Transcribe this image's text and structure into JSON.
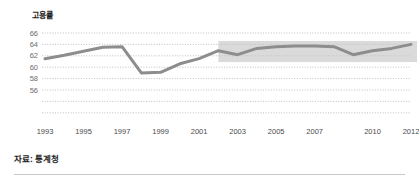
{
  "chart_data": {
    "type": "line",
    "title": "고용률",
    "xlabel": "",
    "ylabel": "",
    "ylim": [
      54,
      67
    ],
    "xlim": [
      1993,
      2012
    ],
    "grid": true,
    "legend": null,
    "yticks": [
      66,
      64,
      62,
      60,
      58,
      56
    ],
    "xticks": [
      1993,
      1995,
      1997,
      1999,
      2001,
      2003,
      2005,
      2007,
      2010,
      2012
    ],
    "x": [
      1993,
      1994,
      1995,
      1996,
      1997,
      1998,
      1999,
      2000,
      2001,
      2002,
      2003,
      2004,
      2005,
      2006,
      2007,
      2008,
      2009,
      2010,
      2011,
      2012
    ],
    "values": [
      61.5,
      62.1,
      62.8,
      63.5,
      63.6,
      59.0,
      59.1,
      60.6,
      61.5,
      62.9,
      62.2,
      63.3,
      63.6,
      63.7,
      63.7,
      63.6,
      62.2,
      62.9,
      63.3,
      64.0
    ],
    "series": [
      {
        "name": "고용률",
        "color": "#8d8d8d",
        "values": [
          61.5,
          62.1,
          62.8,
          63.5,
          63.6,
          59.0,
          59.1,
          60.6,
          61.5,
          62.9,
          62.2,
          63.3,
          63.6,
          63.7,
          63.7,
          63.6,
          62.2,
          62.9,
          63.3,
          64.0
        ]
      }
    ],
    "annotations": [
      {
        "kind": "shaded-band",
        "label": "highlight-band",
        "x_start": 2002,
        "x_end": 2012,
        "y_start": 60.9,
        "y_end": 64.6,
        "color": "#c4c4c4"
      }
    ],
    "source": "자료: 통계청"
  },
  "axis": {
    "y_labels": [
      "66",
      "64",
      "62",
      "60",
      "58",
      "56"
    ],
    "x_labels": [
      "1993",
      "1995",
      "1997",
      "1999",
      "2001",
      "2003",
      "2005",
      "2007",
      "2010",
      "2012"
    ]
  },
  "footer": {
    "source_label": "자료: 통계청"
  },
  "colors": {
    "line": "#8d8d8d",
    "band": "#c4c4c4",
    "gridline": "#b8b8b8",
    "tick_text": "#6d6d6d",
    "rule": "#c9c9c9"
  }
}
